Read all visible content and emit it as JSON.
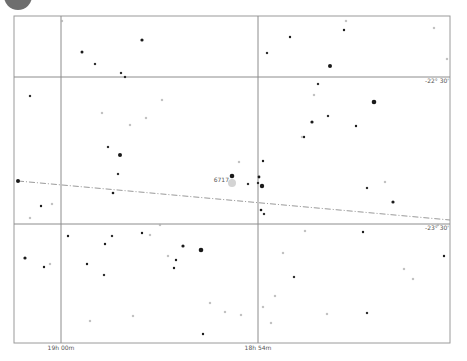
{
  "chart_data": {
    "type": "scatter",
    "title": "",
    "frame": {
      "left": 14,
      "top": 16,
      "right": 450,
      "bottom": 343
    },
    "colors": {
      "frame": "#9a9a9a",
      "grid": "#8c8c8c",
      "star": "#1a1a1a",
      "faint": "#b0b0b0",
      "ecliptic": "#9a9a9a",
      "corner_badge": "#6e6e6e",
      "highlight": "#c8c8c8"
    },
    "ra_grid": [
      {
        "x": 61,
        "label": "19h 00m"
      },
      {
        "x": 258,
        "label": "18h 54m"
      }
    ],
    "dec_grid": [
      {
        "y": 77,
        "label": "-22° 30'"
      },
      {
        "y": 224,
        "label": "-23° 30'"
      }
    ],
    "ecliptic_line": {
      "x1": 18,
      "y1": 181,
      "x2": 450,
      "y2": 220
    },
    "target": {
      "x": 232,
      "y": 180,
      "label": "6717"
    },
    "stars": [
      {
        "x": 18,
        "y": 181,
        "r": 2.0
      },
      {
        "x": 82,
        "y": 52,
        "r": 1.5
      },
      {
        "x": 95,
        "y": 64,
        "r": 1.0
      },
      {
        "x": 121,
        "y": 73,
        "r": 1.0
      },
      {
        "x": 142,
        "y": 40,
        "r": 1.6
      },
      {
        "x": 120,
        "y": 155,
        "r": 2.0
      },
      {
        "x": 108,
        "y": 147,
        "r": 1.0
      },
      {
        "x": 118,
        "y": 174,
        "r": 1.0
      },
      {
        "x": 113,
        "y": 193,
        "r": 1.3
      },
      {
        "x": 146,
        "y": 118,
        "r": 0.8
      },
      {
        "x": 102,
        "y": 113,
        "r": 0.8
      },
      {
        "x": 30,
        "y": 96,
        "r": 1.0
      },
      {
        "x": 41,
        "y": 206,
        "r": 1.2
      },
      {
        "x": 52,
        "y": 204,
        "r": 0.8
      },
      {
        "x": 125,
        "y": 77,
        "r": 1.0
      },
      {
        "x": 62,
        "y": 21,
        "r": 0.8
      },
      {
        "x": 232,
        "y": 176,
        "r": 2.3
      },
      {
        "x": 263,
        "y": 161,
        "r": 1.2
      },
      {
        "x": 259,
        "y": 177,
        "r": 1.4
      },
      {
        "x": 262,
        "y": 186,
        "r": 2.2
      },
      {
        "x": 258,
        "y": 183,
        "r": 1.0
      },
      {
        "x": 261,
        "y": 210,
        "r": 1.3
      },
      {
        "x": 264,
        "y": 214,
        "r": 1.0
      },
      {
        "x": 248,
        "y": 184,
        "r": 1.0
      },
      {
        "x": 239,
        "y": 162,
        "r": 0.8
      },
      {
        "x": 290,
        "y": 37,
        "r": 1.2
      },
      {
        "x": 267,
        "y": 53,
        "r": 1.0
      },
      {
        "x": 330,
        "y": 66,
        "r": 2.0
      },
      {
        "x": 344,
        "y": 30,
        "r": 1.2
      },
      {
        "x": 346,
        "y": 21,
        "r": 0.8
      },
      {
        "x": 374,
        "y": 102,
        "r": 2.3
      },
      {
        "x": 312,
        "y": 122,
        "r": 1.6
      },
      {
        "x": 304,
        "y": 137,
        "r": 1.2
      },
      {
        "x": 328,
        "y": 116,
        "r": 1.0
      },
      {
        "x": 356,
        "y": 126,
        "r": 1.2
      },
      {
        "x": 318,
        "y": 84,
        "r": 1.0
      },
      {
        "x": 314,
        "y": 95,
        "r": 0.8
      },
      {
        "x": 302,
        "y": 137,
        "r": 0.8
      },
      {
        "x": 393,
        "y": 202,
        "r": 1.6
      },
      {
        "x": 367,
        "y": 188,
        "r": 1.0
      },
      {
        "x": 385,
        "y": 182,
        "r": 0.8
      },
      {
        "x": 434,
        "y": 28,
        "r": 0.8
      },
      {
        "x": 447,
        "y": 59,
        "r": 0.8
      },
      {
        "x": 444,
        "y": 256,
        "r": 1.2
      },
      {
        "x": 363,
        "y": 232,
        "r": 1.2
      },
      {
        "x": 294,
        "y": 277,
        "r": 1.0
      },
      {
        "x": 367,
        "y": 313,
        "r": 1.0
      },
      {
        "x": 327,
        "y": 314,
        "r": 0.8
      },
      {
        "x": 201,
        "y": 250,
        "r": 2.3
      },
      {
        "x": 183,
        "y": 246,
        "r": 1.6
      },
      {
        "x": 176,
        "y": 260,
        "r": 1.2
      },
      {
        "x": 174,
        "y": 268,
        "r": 1.2
      },
      {
        "x": 168,
        "y": 256,
        "r": 0.8
      },
      {
        "x": 142,
        "y": 233,
        "r": 1.2
      },
      {
        "x": 112,
        "y": 236,
        "r": 1.0
      },
      {
        "x": 68,
        "y": 236,
        "r": 1.2
      },
      {
        "x": 105,
        "y": 244,
        "r": 1.2
      },
      {
        "x": 87,
        "y": 264,
        "r": 1.2
      },
      {
        "x": 104,
        "y": 275,
        "r": 1.0
      },
      {
        "x": 25,
        "y": 258,
        "r": 1.6
      },
      {
        "x": 44,
        "y": 267,
        "r": 1.2
      },
      {
        "x": 50,
        "y": 264,
        "r": 0.8
      },
      {
        "x": 150,
        "y": 235,
        "r": 0.8
      },
      {
        "x": 203,
        "y": 334,
        "r": 1.2
      },
      {
        "x": 210,
        "y": 303,
        "r": 0.8
      },
      {
        "x": 225,
        "y": 312,
        "r": 0.8
      },
      {
        "x": 160,
        "y": 225,
        "r": 0.8
      },
      {
        "x": 275,
        "y": 296,
        "r": 0.8
      },
      {
        "x": 271,
        "y": 323,
        "r": 0.8
      },
      {
        "x": 263,
        "y": 307,
        "r": 0.8
      },
      {
        "x": 305,
        "y": 231,
        "r": 0.8
      },
      {
        "x": 241,
        "y": 315,
        "r": 0.8
      },
      {
        "x": 130,
        "y": 125,
        "r": 0.8
      },
      {
        "x": 162,
        "y": 100,
        "r": 0.8
      },
      {
        "x": 90,
        "y": 321,
        "r": 0.8
      },
      {
        "x": 30,
        "y": 218,
        "r": 0.8
      },
      {
        "x": 133,
        "y": 316,
        "r": 0.8
      },
      {
        "x": 438,
        "y": 225,
        "r": 0.8
      },
      {
        "x": 413,
        "y": 279,
        "r": 0.8
      },
      {
        "x": 404,
        "y": 269,
        "r": 0.8
      },
      {
        "x": 283,
        "y": 253,
        "r": 0.8
      }
    ]
  }
}
